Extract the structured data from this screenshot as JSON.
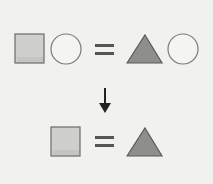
{
  "diagram": {
    "rows": [
      {
        "left": [
          "square",
          "circle"
        ],
        "operator": "=",
        "right": [
          "triangle",
          "circle"
        ]
      },
      {
        "left": [
          "square"
        ],
        "operator": "=",
        "right": [
          "triangle"
        ]
      }
    ],
    "transition": "down-arrow-icon",
    "colors": {
      "background": "#f1f1ef",
      "square_fill": "#cfcfcd",
      "square_stroke": "#6a6a68",
      "circle_fill": "#f4f4f2",
      "circle_stroke": "#7a7a78",
      "triangle_fill": "#8e8e8c",
      "triangle_stroke": "#5a5a58",
      "equals": "#555555",
      "arrow": "#222222"
    }
  }
}
